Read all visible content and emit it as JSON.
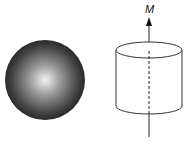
{
  "diagram": {
    "sphere": {
      "cx": 45,
      "cy": 80,
      "r": 40,
      "highlight_color": "#f2f2f2",
      "edge_color": "#1a1a1a"
    },
    "cylinder": {
      "left": 116,
      "right": 182,
      "top_y": 50,
      "bottom_y": 106,
      "ry": 8,
      "stroke": "#333333"
    },
    "axis": {
      "x": 149,
      "y_top": 18,
      "y_bottom": 137,
      "label": "M"
    }
  }
}
